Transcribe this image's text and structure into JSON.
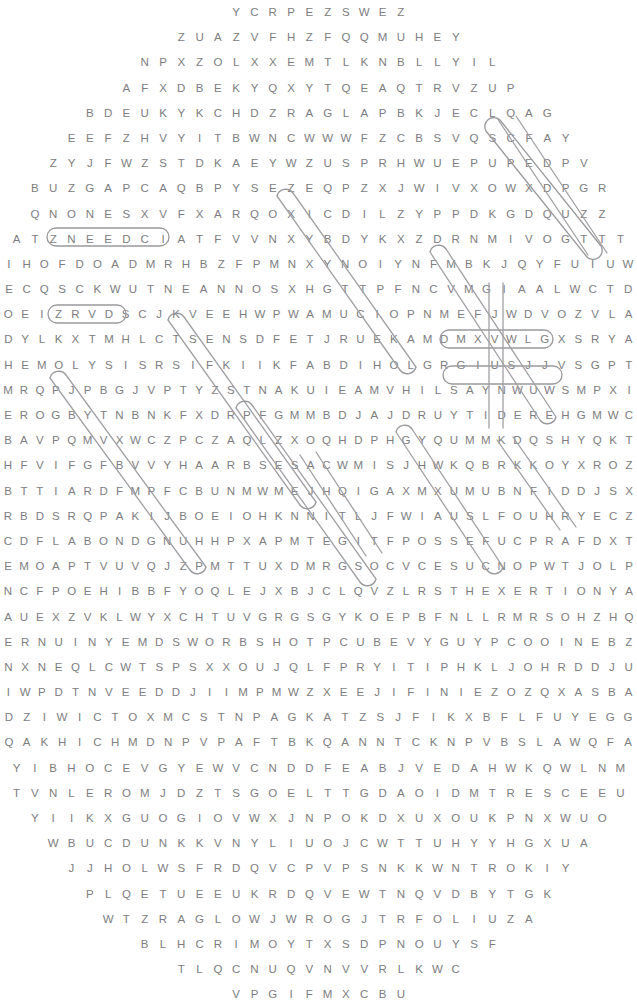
{
  "puzzle": {
    "title": "Word Search Puzzle",
    "shape": "circle",
    "letter_color": "#7d7d80",
    "mark_color": "#9a9a9e",
    "background_color": "#ffffff",
    "rows": [
      "YCRPEZSWEZ",
      "ZUAZVFHZFQQMUHEY",
      "NPXZOLXXEMTLKNBLLYIL",
      "AFXDBEKYQXYTQEAQTRVZUP",
      "BDEUKYKCHDZRAGLAPBKJECLQAG",
      "EEFZHVYITBWNCWWWFZCBSVQSCFAY",
      "ZYJFWZSTDKAEYWZUSPRHWUEPUPEDPV",
      "BUZGAPCAQBPYSEZEQPZXJWIVXOWXDPGR",
      "QNONESXVFXARQOXICDILZYPPDKGDQUZZ",
      "ATZNEEDCIATFVVNXYBDYKXZDRNMIVOGTTT",
      "IHOFDOADMRHBZFPMNXYNOIYNFMBKJQYFUIUW",
      "ECQSCKWUTNEANNOSXHGTTPFNCVMGIAALWCTD",
      "OEIZRVDSCJKVEEHWPWAMUCIOPNMEFJWDVOZVLA",
      "DYLKXTMHLCTSENSDFETJRUEKAMDMXVWLGXSRYA",
      "HEMOLYSISRSIFKIIKFABDIHOLGRGIUSJJVSGPT",
      "MRQPJPBGJVPTYZSTNAKUIEAMVHILSAYNWUWSMPXI",
      "EROGBYTNBNKFXDRPFGMMBDJAJDRUYTIDEREHGMWC",
      "BAVPQMVXWCZPCZAQLZXOQHDPHGYQUMMKDQSHYQKT",
      "HFVIFGFBVVYHAARBSESACWMISJHWKQBRKKOYXROZ",
      "BTTIARDFMPFCBUNMWMEJHQIGAXMXUMUBNFIDDJSX",
      "RBDSRQPAKIJBOEIOHKNNITLJFWIAUSLFOUHRYECZ",
      "CDFLABONDGNUHHPXAPMTEGITFPOSSEFUCPRAFDXT",
      "EMOAPTVUVQJZPMTTUXDMRGSOCVCESUCNOPWTJOLP",
      "NCFPOEHIBBFYOQLEJXBJCLQVZLRSTHEXERTIONYA",
      "AUEXZVKLWYXCHTUVGRGSGYKOEPBFNLLRMRSOHZHQ",
      "ERNUINYEMDSWORBSHOTPCUBEVYGUYPCOOINEBZ",
      "NXNEQLCWTSPSXXOUJQLFPRYITIPHKLJOHRDDJU",
      "IWPDTNVEEDDJIIMPMWZXEEJIFINIEZOZQXASBA",
      "DZIWICTOXMCSTNPAGKATZSJFIKXBFLFUYEGG",
      "QAKHICHMDNPVPAFTBKQANNTCKNPVBSLAWQFA",
      "YIBHOCEVGYEWVCNDDFEABJVEDAHWKQWLNM",
      "TVNLEROMJDZTSGOELTTGDAOIDMTRESCEEU",
      "YIIKXGUOGIOVWXJNPOKDXUXOUKPNXWUO",
      "WBUCDUNKKVNYLIUOJCWTTUHYYHGXUA",
      "JJHOLWSFRDQVCPVPSNKKWNTROKIY",
      "PLQETUEEUKRDQVEWTNQVDBYTGK",
      "WTZRAGLOWJWROGJTRFOLIUZA",
      "BLHCRIMOYTXSDPNOUYSF",
      "TLQCNUQVNVVRLKWC",
      "VPGIFMXCBU"
    ],
    "found_words": [
      {
        "text": "HEMOLYSIS",
        "style": "oval-horizontal"
      },
      {
        "text": "YTIDEREH",
        "style": "oval-horizontal"
      },
      {
        "text": "TIART",
        "style": "oval-horizontal"
      },
      {
        "text": "EXERTION",
        "style": "oval-horizontal"
      },
      {
        "text": "ATTITUDE",
        "style": "oval-diagonal"
      },
      {
        "text": "ATHLETIC",
        "style": "oval-diagonal"
      }
    ]
  }
}
